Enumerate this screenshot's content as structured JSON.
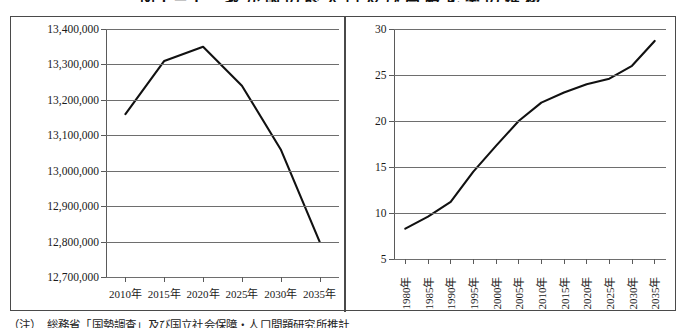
{
  "figure": {
    "title": "図1－1　我が国の総人口及び高齢化率の推移",
    "caption": "（注）　総務省「国勢調査」及び国立社会保障・人口問題研究所推計"
  },
  "chart_data": [
    {
      "type": "line",
      "title": "総人口",
      "panel": "left",
      "xlabel": "",
      "ylabel": "",
      "grid": true,
      "legend": "none",
      "categories": [
        "2010年",
        "2015年",
        "2020年",
        "2025年",
        "2030年",
        "2035年"
      ],
      "x": [
        2010,
        2015,
        2020,
        2025,
        2030,
        2035
      ],
      "values": [
        13160000,
        13310000,
        13350000,
        13240000,
        13060000,
        12800000
      ],
      "ylim": [
        12700000,
        13400000
      ],
      "yticks": [
        12700000,
        12800000,
        12900000,
        13000000,
        13100000,
        13200000,
        13300000,
        13400000
      ],
      "ytick_labels": [
        "12,700,000",
        "12,800,000",
        "12,900,000",
        "13,000,000",
        "13,100,000",
        "13,200,000",
        "13,300,000",
        "13,400,000"
      ],
      "xtick_labels": [
        "2010年",
        "2015年",
        "2020年",
        "2025年",
        "2030年",
        "2035年"
      ]
    },
    {
      "type": "line",
      "title": "高齢化率",
      "panel": "right",
      "xlabel": "",
      "ylabel": "",
      "grid": true,
      "legend": "none",
      "categories": [
        "1980年",
        "1985年",
        "1990年",
        "1995年",
        "2000年",
        "2005年",
        "2010年",
        "2015年",
        "2020年",
        "2025年",
        "2030年",
        "2035年"
      ],
      "x": [
        1980,
        1985,
        1990,
        1995,
        2000,
        2005,
        2010,
        2015,
        2020,
        2025,
        2030,
        2035
      ],
      "values": [
        8.3,
        9.6,
        11.2,
        14.5,
        17.3,
        20.0,
        22.0,
        23.1,
        24.0,
        24.6,
        26.0,
        28.7
      ],
      "ylim": [
        5,
        30
      ],
      "yticks": [
        5,
        10,
        15,
        20,
        25,
        30
      ],
      "ytick_labels": [
        "5",
        "10",
        "15",
        "20",
        "25",
        "30"
      ],
      "xtick_labels": [
        "1980年",
        "1985年",
        "1990年",
        "1995年",
        "2000年",
        "2005年",
        "2010年",
        "2015年",
        "2020年",
        "2025年",
        "2030年",
        "2035年"
      ]
    }
  ]
}
